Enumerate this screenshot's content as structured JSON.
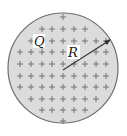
{
  "diagram": {
    "shape": "charged-sphere",
    "labels": {
      "charge": "Q",
      "radius": "R"
    },
    "charge_symbol": "+",
    "colors": {
      "fill": "#dcdcdc",
      "stroke": "#6e6e6e",
      "plus": "#6a6a6a",
      "arrow": "#333333",
      "label_bg": "#ffffff",
      "label_text": "#222222"
    },
    "circle": {
      "cx": 63,
      "cy": 68,
      "r": 55
    },
    "arrow": {
      "x1": 63,
      "y1": 70,
      "x2": 110,
      "y2": 40
    },
    "plus_rows": [
      {
        "y": 17,
        "xs": [
          63
        ]
      },
      {
        "y": 29,
        "xs": [
          42,
          52,
          63,
          74,
          85
        ]
      },
      {
        "y": 41,
        "xs": [
          31,
          52,
          63,
          74,
          85,
          96,
          106
        ]
      },
      {
        "y": 52,
        "xs": [
          20,
          31,
          42,
          52,
          63,
          96,
          106
        ]
      },
      {
        "y": 64,
        "xs": [
          20,
          31,
          42,
          52,
          63,
          74,
          85,
          96,
          106
        ]
      },
      {
        "y": 76,
        "xs": [
          20,
          31,
          42,
          52,
          63,
          74,
          85,
          96,
          106
        ]
      },
      {
        "y": 87,
        "xs": [
          20,
          31,
          42,
          52,
          63,
          74,
          85,
          96,
          106
        ]
      },
      {
        "y": 99,
        "xs": [
          31,
          42,
          52,
          63,
          74,
          85,
          96
        ]
      },
      {
        "y": 110,
        "xs": [
          42,
          52,
          63,
          74,
          85
        ]
      },
      {
        "y": 121,
        "xs": [
          63
        ]
      }
    ]
  }
}
